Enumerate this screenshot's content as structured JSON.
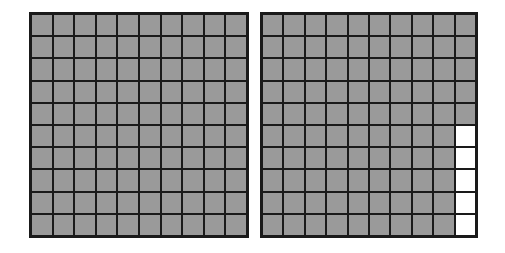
{
  "figure": {
    "shade_color": "#9a9a9a",
    "line_color": "#1a1a1a",
    "empty_color": "#ffffff"
  },
  "grids": [
    {
      "id": "left",
      "rows": 10,
      "cols": 10,
      "shaded_count": 100,
      "unshaded_cells": []
    },
    {
      "id": "right",
      "rows": 10,
      "cols": 10,
      "shaded_count": 95,
      "unshaded_cells": [
        [
          5,
          9
        ],
        [
          6,
          9
        ],
        [
          7,
          9
        ],
        [
          8,
          9
        ],
        [
          9,
          9
        ]
      ]
    }
  ]
}
